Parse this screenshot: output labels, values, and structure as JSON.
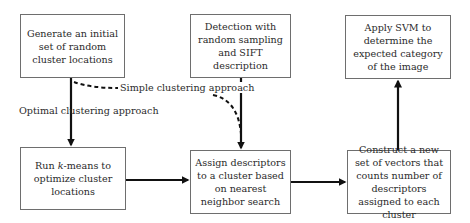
{
  "diagram": {
    "type": "flowchart",
    "nodes": [
      {
        "id": "generate",
        "text": "Generate an initial set of random cluster locations"
      },
      {
        "id": "detection",
        "text": "Detection with random sampling and SIFT description"
      },
      {
        "id": "svm",
        "text": "Apply SVM to determine the expected category of the image"
      },
      {
        "id": "kmeans",
        "text_prefix": "Run ",
        "text_italic": "k",
        "text_suffix": "-means to optimize cluster locations"
      },
      {
        "id": "assign",
        "text": "Assign descriptors to a cluster based on nearest neighbor search"
      },
      {
        "id": "construct",
        "text": "Construct a new set of vectors that counts number of descriptors assigned to each cluster"
      }
    ],
    "edges": [
      {
        "from": "generate",
        "to": "kmeans",
        "style": "solid",
        "label": "Optimal clustering approach"
      },
      {
        "from": "generate",
        "to": "assign",
        "style": "dashed",
        "label": "Simple clustering approach"
      },
      {
        "from": "detection",
        "to": "assign",
        "style": "solid"
      },
      {
        "from": "kmeans",
        "to": "assign",
        "style": "solid"
      },
      {
        "from": "assign",
        "to": "construct",
        "style": "solid"
      },
      {
        "from": "construct",
        "to": "svm",
        "style": "solid"
      }
    ],
    "labels": {
      "optimal": "Optimal clustering approach",
      "simple": "Simple clustering approach"
    },
    "colors": {
      "line": "#111111",
      "box_border": "#6e6e6e",
      "text": "#2a2a2a"
    }
  }
}
